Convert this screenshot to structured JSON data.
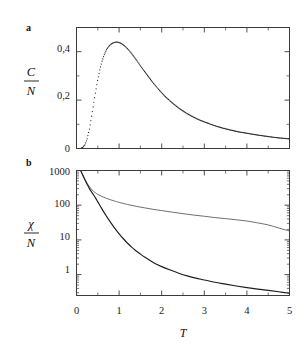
{
  "figure": {
    "background": "#ffffff",
    "panels": [
      {
        "id": "panel-a",
        "label": "a"
      },
      {
        "id": "panel-b",
        "label": "b"
      }
    ]
  },
  "chart_data": [
    {
      "type": "scatter",
      "id": "panel-a",
      "panel_label": "a",
      "title": "",
      "xlabel": "T",
      "ylabel": "C/N",
      "ylabel_numerator": "C",
      "ylabel_denominator": "N",
      "xlim": [
        0,
        5
      ],
      "ylim": [
        0,
        0.5
      ],
      "xticks": [
        0,
        1,
        2,
        3,
        4,
        5
      ],
      "xticklabels": [
        "0",
        "1",
        "2",
        "3",
        "4",
        "5"
      ],
      "xticklabels_visible": false,
      "xminorticks": [
        0.5,
        1.5,
        2.5,
        3.5,
        4.5
      ],
      "yticks": [
        0,
        0.2,
        0.4
      ],
      "yticklabels": [
        "0",
        "0,2",
        "0,4"
      ],
      "yminorticks": [
        0.1,
        0.3,
        0.5
      ],
      "grid": false,
      "legend": false,
      "marker": "dot",
      "series": [
        {
          "name": "C/N",
          "color": "#232323",
          "x": [
            0.05,
            0.1,
            0.15,
            0.2,
            0.25,
            0.3,
            0.35,
            0.4,
            0.45,
            0.5,
            0.55,
            0.6,
            0.65,
            0.7,
            0.75,
            0.8,
            0.85,
            0.9,
            0.95,
            1.0,
            1.05,
            1.1,
            1.15,
            1.2,
            1.25,
            1.3,
            1.35,
            1.4,
            1.45,
            1.5,
            1.6,
            1.7,
            1.8,
            1.9,
            2.0,
            2.1,
            2.2,
            2.3,
            2.4,
            2.5,
            2.6,
            2.7,
            2.8,
            2.9,
            3.0,
            3.2,
            3.4,
            3.6,
            3.8,
            4.0,
            4.2,
            4.4,
            4.6,
            4.8,
            5.0
          ],
          "y": [
            0.0,
            0.001,
            0.005,
            0.016,
            0.04,
            0.078,
            0.128,
            0.183,
            0.237,
            0.286,
            0.327,
            0.361,
            0.387,
            0.407,
            0.421,
            0.43,
            0.436,
            0.439,
            0.44,
            0.438,
            0.434,
            0.428,
            0.421,
            0.412,
            0.402,
            0.391,
            0.379,
            0.367,
            0.355,
            0.342,
            0.318,
            0.294,
            0.271,
            0.25,
            0.23,
            0.212,
            0.196,
            0.181,
            0.167,
            0.155,
            0.144,
            0.134,
            0.125,
            0.117,
            0.11,
            0.097,
            0.086,
            0.077,
            0.069,
            0.063,
            0.057,
            0.052,
            0.047,
            0.043,
            0.04
          ]
        }
      ]
    },
    {
      "type": "line",
      "id": "panel-b",
      "panel_label": "b",
      "title": "",
      "xlabel": "T",
      "ylabel": "chi/N",
      "ylabel_numerator": "χ",
      "ylabel_denominator": "N",
      "xlim": [
        0,
        5
      ],
      "ylim": [
        0.25,
        1000
      ],
      "yscale": "log",
      "xticks": [
        0,
        1,
        2,
        3,
        4,
        5
      ],
      "xticklabels": [
        "0",
        "1",
        "2",
        "3",
        "4",
        "5"
      ],
      "xminorticks": [
        0.5,
        1.5,
        2.5,
        3.5,
        4.5
      ],
      "yticks": [
        1,
        10,
        100,
        1000
      ],
      "yticklabels": [
        "1",
        "10",
        "100",
        "1000"
      ],
      "grid": false,
      "legend": false,
      "series": [
        {
          "name": "upper-branch",
          "color": "#6f6f6f",
          "style": "solid",
          "x": [
            0.1,
            0.15,
            0.2,
            0.25,
            0.3,
            0.35,
            0.4,
            0.45,
            0.5,
            0.6,
            0.7,
            0.8,
            0.9,
            1.0,
            1.2,
            1.4,
            1.6,
            1.8,
            2.0,
            2.25,
            2.5,
            2.75,
            3.0,
            3.25,
            3.5,
            3.75,
            4.0,
            4.25,
            4.5,
            4.75,
            5.0
          ],
          "y": [
            980,
            740,
            560,
            430,
            350,
            290,
            250,
            225,
            205,
            178,
            158,
            143,
            131,
            121,
            105,
            93,
            84,
            76,
            70,
            63,
            57,
            52,
            48,
            44,
            41,
            38,
            35,
            31,
            27,
            22,
            18
          ]
        },
        {
          "name": "lower-branch",
          "color": "#1d1d1d",
          "style": "solid-dotted",
          "x": [
            0.1,
            0.15,
            0.2,
            0.25,
            0.3,
            0.35,
            0.4,
            0.45,
            0.5,
            0.55,
            0.6,
            0.65,
            0.7,
            0.8,
            0.9,
            1.0,
            1.1,
            1.2,
            1.3,
            1.4,
            1.5,
            1.6,
            1.8,
            2.0,
            2.2,
            2.4,
            2.6,
            2.8,
            3.0,
            3.25,
            3.5,
            3.75,
            4.0,
            4.25,
            4.5,
            4.75,
            5.0
          ],
          "y": [
            980,
            720,
            530,
            400,
            305,
            245,
            200,
            160,
            125,
            98,
            77,
            61,
            49,
            32,
            21.5,
            15.0,
            10.8,
            8.0,
            6.1,
            4.8,
            3.9,
            3.2,
            2.25,
            1.7,
            1.35,
            1.1,
            0.92,
            0.79,
            0.7,
            0.6,
            0.53,
            0.47,
            0.42,
            0.38,
            0.35,
            0.32,
            0.29
          ]
        }
      ]
    }
  ]
}
